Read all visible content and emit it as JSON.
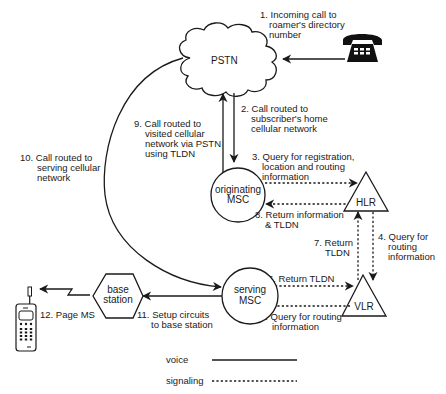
{
  "nodes": {
    "pstn": {
      "label": "PSTN"
    },
    "originating_msc": {
      "line1": "originating",
      "line2": "MSC"
    },
    "serving_msc": {
      "line1": "serving",
      "line2": "MSC"
    },
    "hlr": {
      "label": "HLR"
    },
    "vlr": {
      "label": "VLR"
    },
    "base_station": {
      "line1": "base",
      "line2": "station"
    },
    "telephone": {
      "icon": "telephone-icon"
    },
    "mobile_station": {
      "icon": "mobile-phone-icon"
    }
  },
  "steps": [
    {
      "number": "1.",
      "lines": [
        "Incoming call to",
        "roamer's directory",
        "number"
      ],
      "type": "voice"
    },
    {
      "number": "2.",
      "lines": [
        "Call routed to",
        "subscriber's home",
        "cellular network"
      ],
      "type": "voice"
    },
    {
      "number": "3.",
      "lines": [
        "Query for registration,",
        "location and routing",
        "information"
      ],
      "type": "signaling"
    },
    {
      "number": "4.",
      "lines": [
        "Query for",
        "routing",
        "information"
      ],
      "type": "signaling"
    },
    {
      "number": "5.",
      "lines": [
        "Query for routing",
        "information"
      ],
      "type": "signaling"
    },
    {
      "number": "6.",
      "lines": [
        "Return TLDN"
      ],
      "type": "signaling"
    },
    {
      "number": "7.",
      "lines": [
        "Return",
        "TLDN"
      ],
      "type": "signaling"
    },
    {
      "number": "8.",
      "lines": [
        "Return information",
        "& TLDN"
      ],
      "type": "signaling"
    },
    {
      "number": "9.",
      "lines": [
        "Call routed to",
        "visited cellular",
        "network via PSTN",
        "using TLDN"
      ],
      "type": "voice"
    },
    {
      "number": "10.",
      "lines": [
        "Call routed to",
        "serving cellular",
        "network"
      ],
      "type": "voice"
    },
    {
      "number": "11.",
      "lines": [
        "Setup circuits",
        "to base station"
      ],
      "type": "voice"
    },
    {
      "number": "12.",
      "lines": [
        "Page MS"
      ],
      "type": "voice"
    }
  ],
  "legend": {
    "voice": {
      "label": "voice",
      "style": "solid"
    },
    "signaling": {
      "label": "signaling",
      "style": "dashed"
    }
  },
  "colors": {
    "ink": "#1a1a1a",
    "background": "#ffffff"
  }
}
